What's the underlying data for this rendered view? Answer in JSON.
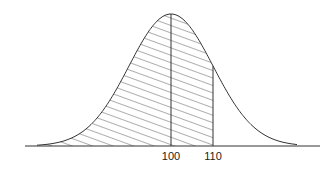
{
  "chart_data": {
    "type": "area",
    "title": "",
    "xlabel": "",
    "ylabel": "",
    "distribution": "normal",
    "mean": 100,
    "shaded_region": {
      "from": "-inf",
      "to": 110,
      "pattern": "diagonal-hatch"
    },
    "vertical_lines": [
      100,
      110
    ],
    "tick_labels": [
      "100",
      "110"
    ],
    "grid": false,
    "legend": null
  },
  "labels": {
    "tick_100": "100",
    "tick_110": "110"
  }
}
